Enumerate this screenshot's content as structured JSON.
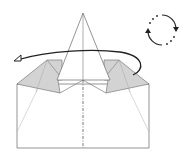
{
  "diagram": {
    "type": "origami-step",
    "colors": {
      "paper_front": "#ffffff",
      "paper_back": "#d3d3d3",
      "outline": "#7a7a7a",
      "crease_line": "#9a9a9a",
      "arrow": "#222222",
      "center_line": "#555555"
    },
    "symbols": [
      {
        "name": "turn-over-arrow",
        "meaning": "turn model over"
      },
      {
        "name": "rotate-symbol",
        "meaning": "rotate / flip over"
      }
    ],
    "lines": [
      {
        "name": "center-valley-line",
        "style": "dash-dot"
      }
    ]
  }
}
